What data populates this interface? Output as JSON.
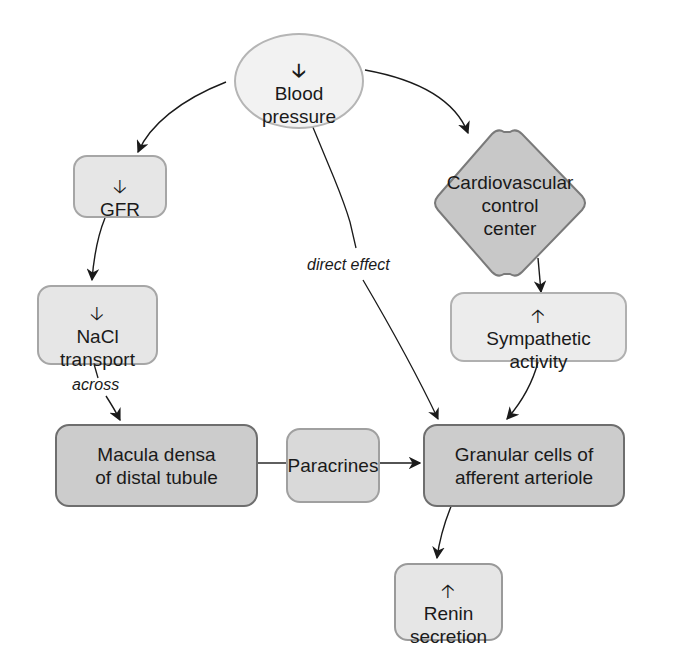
{
  "diagram": {
    "nodes": {
      "blood_pressure": {
        "arrow": "down",
        "text": "Blood\npressure"
      },
      "gfr": {
        "arrow": "down",
        "text": "GFR"
      },
      "cardiovascular": {
        "text": "Cardiovascular\ncontrol\ncenter"
      },
      "nacl": {
        "arrow": "down",
        "text": "NaCl\ntransport"
      },
      "sympathetic": {
        "arrow": "up",
        "text": "Sympathetic\nactivity"
      },
      "macula": {
        "text": "Macula densa\nof distal tubule"
      },
      "paracrines": {
        "text": "Paracrines"
      },
      "granular": {
        "text": "Granular cells of\nafferent arteriole"
      },
      "renin": {
        "arrow": "up",
        "text": "Renin\nsecretion"
      }
    },
    "edge_labels": {
      "direct_effect": "direct effect",
      "across": "across"
    },
    "edges": [
      {
        "from": "blood_pressure",
        "to": "gfr"
      },
      {
        "from": "blood_pressure",
        "to": "cardiovascular"
      },
      {
        "from": "blood_pressure",
        "to": "granular",
        "label": "direct effect"
      },
      {
        "from": "gfr",
        "to": "nacl"
      },
      {
        "from": "nacl",
        "to": "macula",
        "label": "across"
      },
      {
        "from": "cardiovascular",
        "to": "sympathetic"
      },
      {
        "from": "sympathetic",
        "to": "granular"
      },
      {
        "from": "macula",
        "to": "paracrines"
      },
      {
        "from": "paracrines",
        "to": "granular"
      },
      {
        "from": "granular",
        "to": "renin"
      }
    ],
    "colors": {
      "light_fill": "#e6e6e6",
      "dark_fill": "#cccccc",
      "ellipse_fill": "#f2f2f2",
      "line": "#1a1a1a"
    }
  }
}
